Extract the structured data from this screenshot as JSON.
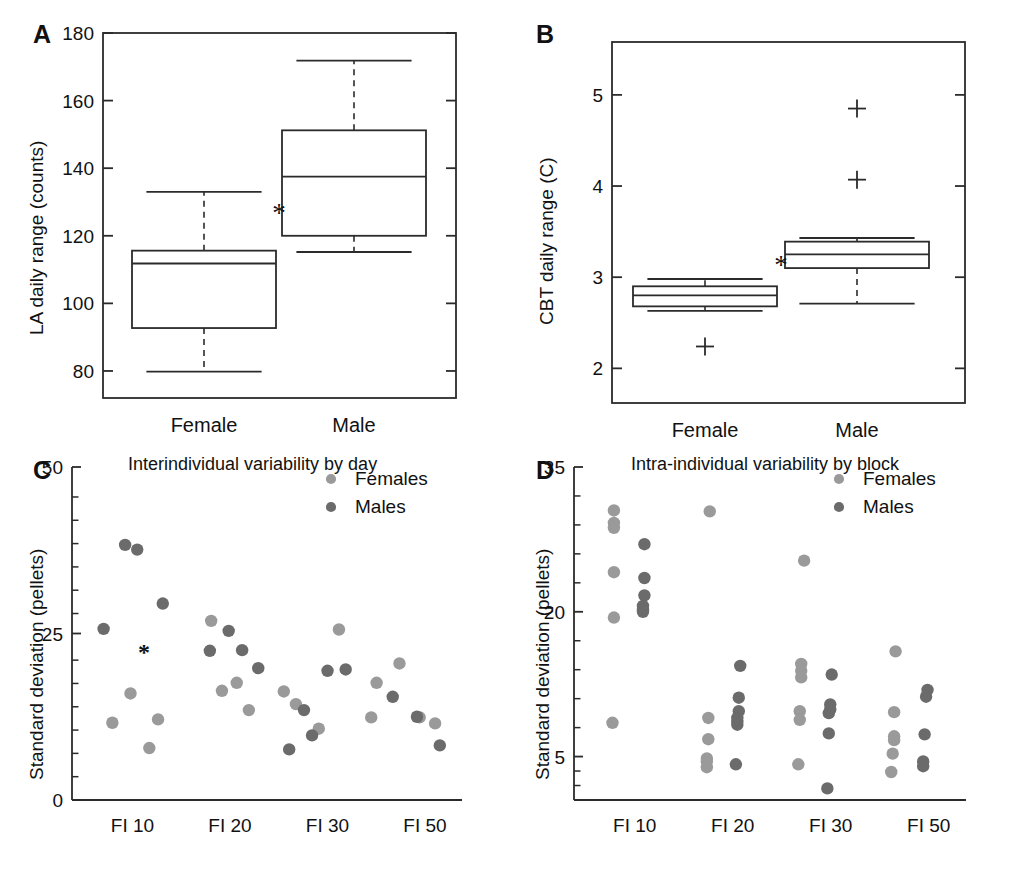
{
  "figure": {
    "panels": [
      "A",
      "B",
      "C",
      "D"
    ]
  },
  "panel_a": {
    "letter": "A",
    "ylabel": "LA daily range (counts)",
    "yticks": [
      "180",
      "160",
      "140",
      "120",
      "100",
      "80"
    ],
    "categories": [
      "Female",
      "Male"
    ],
    "significance_marker": "*"
  },
  "panel_b": {
    "letter": "B",
    "ylabel": "CBT daily range (C)",
    "yticks": [
      "5",
      "4",
      "3",
      "2"
    ],
    "categories": [
      "Female",
      "Male"
    ],
    "significance_marker": "*"
  },
  "panel_c": {
    "letter": "C",
    "title": "Interindividual variability by day",
    "ylabel": "Standard deviation (pellets)",
    "yticks": [
      "50",
      "25",
      "0"
    ],
    "xticks": [
      "FI 10",
      "FI 20",
      "FI 30",
      "FI 50"
    ],
    "legend": [
      "Females",
      "Males"
    ],
    "significance_marker": "*"
  },
  "panel_d": {
    "letter": "D",
    "title": "Intra-individual variability by block",
    "ylabel": "Standard deviation (pellets)",
    "yticks": [
      "35",
      "20",
      "5"
    ],
    "xticks": [
      "FI 10",
      "FI 20",
      "FI 30",
      "FI 50"
    ],
    "legend": [
      "Females",
      "Males"
    ]
  },
  "colors": {
    "female_marker": "#9a9a9a",
    "male_marker": "#6b6b6b",
    "axis": "#2b2b2b",
    "text": "#111111"
  },
  "chart_data": [
    {
      "id": "panel_a",
      "type": "box",
      "title": "",
      "xlabel": "",
      "ylabel": "LA daily range (counts)",
      "ylim": [
        72,
        180
      ],
      "yticks": [
        80,
        100,
        120,
        140,
        160,
        180
      ],
      "categories": [
        "Female",
        "Male"
      ],
      "grid": false,
      "annotations": [
        {
          "text": "*",
          "between": [
            "Female",
            "Male"
          ],
          "y": 126.5
        }
      ],
      "boxes": [
        {
          "category": "Female",
          "whisker_low": 79.8,
          "q1": 92.7,
          "median": 111.8,
          "q3": 115.6,
          "whisker_high": 133.0,
          "outliers": []
        },
        {
          "category": "Male",
          "whisker_low": 115.2,
          "q1": 120.0,
          "median": 137.5,
          "q3": 151.2,
          "whisker_high": 171.8,
          "outliers": []
        }
      ]
    },
    {
      "id": "panel_b",
      "type": "box",
      "title": "",
      "xlabel": "",
      "ylabel": "CBT daily range (C)",
      "ylim": [
        1.62,
        5.58
      ],
      "yticks": [
        2,
        3,
        4,
        5
      ],
      "categories": [
        "Female",
        "Male"
      ],
      "grid": false,
      "annotations": [
        {
          "text": "*",
          "between": [
            "Female",
            "Male"
          ],
          "y": 3.12
        }
      ],
      "boxes": [
        {
          "category": "Female",
          "whisker_low": 2.63,
          "q1": 2.68,
          "median": 2.8,
          "q3": 2.9,
          "whisker_high": 2.98,
          "outliers": [
            2.24
          ]
        },
        {
          "category": "Male",
          "whisker_low": 2.71,
          "q1": 3.1,
          "median": 3.25,
          "q3": 3.39,
          "whisker_high": 3.43,
          "outliers": [
            4.07,
            4.85
          ]
        }
      ]
    },
    {
      "id": "panel_c",
      "type": "scatter",
      "title": "Interindividual variability by day",
      "xlabel": "",
      "ylabel": "Standard deviation (pellets)",
      "ylim": [
        0,
        50
      ],
      "yticks": [
        0,
        25,
        50
      ],
      "xticks": [
        "FI 10",
        "FI 20",
        "FI 30",
        "FI 50"
      ],
      "legend": [
        "Females",
        "Males"
      ],
      "legend_position": "top-right",
      "grid": false,
      "annotations": [
        {
          "text": "*",
          "x": 0.72,
          "y": 22.2
        }
      ],
      "series": [
        {
          "name": "Females",
          "color": "#9a9a9a",
          "points": [
            {
              "x": 0.52,
              "y": 16.0
            },
            {
              "x": 0.25,
              "y": 11.6
            },
            {
              "x": 0.93,
              "y": 12.1
            },
            {
              "x": 0.8,
              "y": 7.8
            },
            {
              "x": 1.72,
              "y": 26.9
            },
            {
              "x": 1.88,
              "y": 16.4
            },
            {
              "x": 2.1,
              "y": 17.6
            },
            {
              "x": 2.28,
              "y": 13.5
            },
            {
              "x": 2.8,
              "y": 16.3
            },
            {
              "x": 2.98,
              "y": 14.4
            },
            {
              "x": 3.32,
              "y": 10.7
            },
            {
              "x": 3.62,
              "y": 25.6
            },
            {
              "x": 4.18,
              "y": 17.6
            },
            {
              "x": 4.1,
              "y": 12.4
            },
            {
              "x": 4.52,
              "y": 20.5
            },
            {
              "x": 4.82,
              "y": 12.4
            },
            {
              "x": 5.05,
              "y": 11.5
            }
          ]
        },
        {
          "name": "Males",
          "color": "#6b6b6b",
          "points": [
            {
              "x": 0.12,
              "y": 25.7
            },
            {
              "x": 0.44,
              "y": 38.3
            },
            {
              "x": 0.62,
              "y": 37.6
            },
            {
              "x": 1.0,
              "y": 29.5
            },
            {
              "x": 1.7,
              "y": 22.4
            },
            {
              "x": 1.98,
              "y": 25.4
            },
            {
              "x": 2.18,
              "y": 22.5
            },
            {
              "x": 2.42,
              "y": 19.8
            },
            {
              "x": 3.1,
              "y": 13.5
            },
            {
              "x": 3.22,
              "y": 9.7
            },
            {
              "x": 2.88,
              "y": 7.6
            },
            {
              "x": 3.45,
              "y": 19.4
            },
            {
              "x": 3.72,
              "y": 19.6
            },
            {
              "x": 4.42,
              "y": 15.5
            },
            {
              "x": 4.78,
              "y": 12.5
            },
            {
              "x": 5.12,
              "y": 8.2
            }
          ]
        }
      ]
    },
    {
      "id": "panel_d",
      "type": "scatter",
      "title": "Intra-individual variability by block",
      "xlabel": "",
      "ylabel": "Standard deviation (pellets)",
      "ylim": [
        0.5,
        35
      ],
      "yticks": [
        5,
        20,
        35
      ],
      "xticks": [
        "FI 10",
        "FI 20",
        "FI 30",
        "FI 50"
      ],
      "legend": [
        "Females",
        "Males"
      ],
      "legend_position": "top-right",
      "grid": false,
      "series": [
        {
          "name": "Females",
          "color": "#9a9a9a",
          "points": [
            {
              "x": 0.3,
              "y": 30.5
            },
            {
              "x": 0.3,
              "y": 29.2
            },
            {
              "x": 0.3,
              "y": 28.7
            },
            {
              "x": 0.3,
              "y": 24.1
            },
            {
              "x": 0.3,
              "y": 19.4
            },
            {
              "x": 0.28,
              "y": 8.5
            },
            {
              "x": 1.62,
              "y": 30.4
            },
            {
              "x": 1.6,
              "y": 9.0
            },
            {
              "x": 1.6,
              "y": 6.8
            },
            {
              "x": 1.58,
              "y": 4.8
            },
            {
              "x": 1.58,
              "y": 4.5
            },
            {
              "x": 1.58,
              "y": 3.9
            },
            {
              "x": 2.92,
              "y": 25.3
            },
            {
              "x": 2.88,
              "y": 14.6
            },
            {
              "x": 2.88,
              "y": 13.9
            },
            {
              "x": 2.88,
              "y": 13.2
            },
            {
              "x": 2.86,
              "y": 9.7
            },
            {
              "x": 2.86,
              "y": 8.8
            },
            {
              "x": 2.84,
              "y": 4.2
            },
            {
              "x": 4.18,
              "y": 15.9
            },
            {
              "x": 4.16,
              "y": 9.6
            },
            {
              "x": 4.16,
              "y": 7.1
            },
            {
              "x": 4.16,
              "y": 6.7
            },
            {
              "x": 4.14,
              "y": 5.3
            },
            {
              "x": 4.12,
              "y": 3.4
            }
          ]
        },
        {
          "name": "Males",
          "color": "#6b6b6b",
          "points": [
            {
              "x": 0.72,
              "y": 27.0
            },
            {
              "x": 0.72,
              "y": 23.5
            },
            {
              "x": 0.72,
              "y": 21.7
            },
            {
              "x": 0.7,
              "y": 20.6
            },
            {
              "x": 0.7,
              "y": 20.2
            },
            {
              "x": 0.7,
              "y": 20.0
            },
            {
              "x": 2.04,
              "y": 14.4
            },
            {
              "x": 2.02,
              "y": 11.1
            },
            {
              "x": 2.02,
              "y": 9.7
            },
            {
              "x": 2.0,
              "y": 9.0
            },
            {
              "x": 2.0,
              "y": 8.6
            },
            {
              "x": 2.0,
              "y": 8.3
            },
            {
              "x": 1.98,
              "y": 4.2
            },
            {
              "x": 3.3,
              "y": 13.5
            },
            {
              "x": 3.28,
              "y": 10.4
            },
            {
              "x": 3.28,
              "y": 9.9
            },
            {
              "x": 3.26,
              "y": 9.5
            },
            {
              "x": 3.26,
              "y": 7.4
            },
            {
              "x": 3.24,
              "y": 1.7
            },
            {
              "x": 4.62,
              "y": 11.9
            },
            {
              "x": 4.6,
              "y": 11.2
            },
            {
              "x": 4.58,
              "y": 7.3
            },
            {
              "x": 4.56,
              "y": 4.5
            },
            {
              "x": 4.56,
              "y": 4.0
            }
          ]
        }
      ]
    }
  ]
}
